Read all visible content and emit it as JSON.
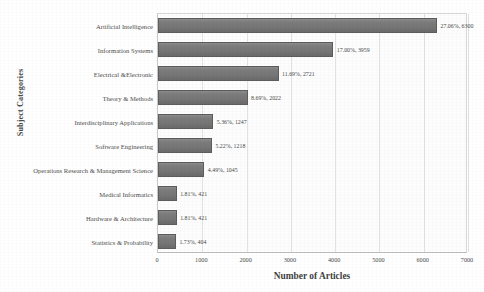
{
  "chart_data": {
    "type": "bar",
    "orientation": "horizontal",
    "title": "",
    "xlabel": "Number of Articles",
    "ylabel": "Subject Categories",
    "xlim": [
      0,
      7000
    ],
    "xticks": [
      "0",
      "1000",
      "2000",
      "3000",
      "4000",
      "5000",
      "6000",
      "7000"
    ],
    "grid": true,
    "legend": null,
    "bar_color": "#7a7a7a",
    "categories": [
      "Artificial Intelligence",
      "Information Systems",
      "Electrical &Electronic",
      "Theory & Methods",
      "Interdisciplinary Applications",
      "Software Engineering",
      "Operations Research & Management Science",
      "Medical Informatics",
      "Hardware & Architecture",
      "Statistics & Probability"
    ],
    "values": [
      6300,
      3959,
      2721,
      2022,
      1247,
      1218,
      1045,
      421,
      421,
      404
    ],
    "percents": [
      "27.06%",
      "17.00%",
      "11.69%",
      "8.69%",
      "5.36%",
      "5.22%",
      "4.49%",
      "1.81%",
      "1.81%",
      "1.73%"
    ],
    "labels": [
      "27.06%, 6300",
      "17.00%, 3959",
      "11.69%, 2721",
      "8.69%, 2022",
      "5.36%, 1247",
      "5.22%, 1218",
      "4.49%, 1045",
      "1.81%, 421",
      "1.81%, 421",
      "1.73%, 404"
    ]
  }
}
